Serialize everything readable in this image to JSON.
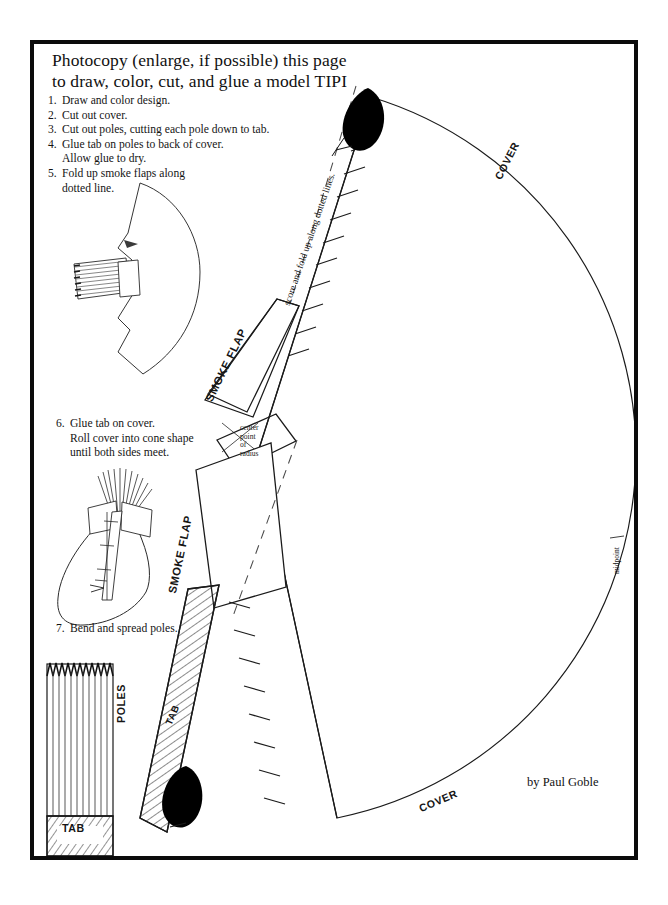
{
  "document": {
    "title_line1": "Photocopy (enlarge, if possible) this page",
    "title_line2": "to draw, color, cut, and glue a model TIPI",
    "credit": "by Paul Goble"
  },
  "instructions": [
    {
      "num": "1.",
      "text": "Draw and color design.",
      "continuation": ""
    },
    {
      "num": "2.",
      "text": "Cut out cover.",
      "continuation": ""
    },
    {
      "num": "3.",
      "text": "Cut out poles, cutting each pole down to tab.",
      "continuation": ""
    },
    {
      "num": "4.",
      "text": "Glue tab on poles to back of cover.",
      "continuation": "Allow glue to dry."
    },
    {
      "num": "5.",
      "text": "Fold up smoke flaps along",
      "continuation": "dotted line."
    }
  ],
  "instructions2": [
    {
      "num": "6.",
      "text": "Glue tab on cover.",
      "continuation": "Roll cover into cone shape",
      "continuation2": "until both sides meet."
    }
  ],
  "instructions3": [
    {
      "num": "7.",
      "text": "Bend and spread poles.",
      "continuation": ""
    }
  ],
  "labels": {
    "score_fold": "score and fold up along dotted lines.",
    "smoke_flap_upper": "SMOKE FLAP",
    "smoke_flap_lower": "SMOKE FLAP",
    "cover_upper": "COVER",
    "cover_lower": "COVER",
    "poles": "POLES",
    "tab_strip": "TAB",
    "tab_box": "TAB",
    "midpoint": "midpoint",
    "center_point_l1": "center",
    "center_point_l2": "point",
    "center_point_l3": "of",
    "center_point_l4": "radius"
  },
  "colors": {
    "ink": "#111111",
    "frame": "#0b0b0b",
    "fill": "#ffffff",
    "solid_black": "#000000",
    "hatch": "#333333"
  },
  "geometry": {
    "frame_left": 30,
    "frame_top": 40,
    "frame_width": 608,
    "frame_height": 820,
    "arc_center_x": 258,
    "arc_center_y": 452,
    "arc_radius": 372,
    "pole_count": 11,
    "tick_count_upper": 11,
    "tick_count_lower": 9
  }
}
